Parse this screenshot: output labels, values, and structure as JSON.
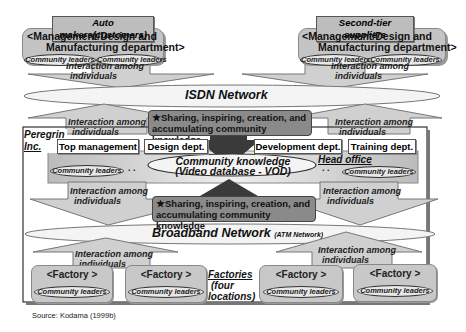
{
  "top_groups": [
    {
      "tag": "Auto makers(customers)",
      "mgmt_line1": "<Management/Design and",
      "mgmt_line2": "Manufacturing department>",
      "leaders": [
        "Community leaders",
        "Community leaders"
      ]
    },
    {
      "tag": "Second-tier suppliers",
      "mgmt_line1": "<Management/Design and",
      "mgmt_line2": "Manufacturing department>",
      "leaders": [
        "Community leaders",
        "Community leaders"
      ]
    }
  ],
  "interaction": {
    "line1": "Interaction among",
    "line2": "individuals"
  },
  "isdn": {
    "label": "ISDN Network"
  },
  "sharing": {
    "line1": "★Sharing, inspiring, creation, and",
    "line2": "accumulating community knowledge"
  },
  "peregrin": {
    "line1": "Peregrin",
    "line2": "Inc."
  },
  "depts": [
    "Top management",
    "Design dept.",
    "Development dept.",
    "Training dept."
  ],
  "head_office": {
    "label": "Head office",
    "knowledge_line1": "Community knowledge",
    "knowledge_line2": "(Video database - VOD)",
    "leaders": [
      "Community leaders",
      "Community leaders"
    ],
    "dots": ". ."
  },
  "broadband": {
    "label": "Broadband Network",
    "sub": "(ATM Network)"
  },
  "factories": {
    "items": [
      {
        "label": "<Factory >",
        "leaders": "Community leaders"
      },
      {
        "label": "<Factory >",
        "leaders": "Community leaders"
      },
      {
        "label": "<Factory >",
        "leaders": "Community leaders"
      },
      {
        "label": "<Factory >",
        "leaders": "Community leaders"
      }
    ],
    "caption_line1": "Factories",
    "caption_line2": "(four",
    "caption_line3": "locations)"
  },
  "source": "Source: Kodama (1999b)"
}
